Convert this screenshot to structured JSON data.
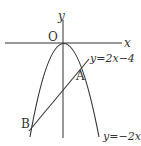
{
  "figure": {
    "axis_labels": {
      "x": "x",
      "y": "y",
      "origin": "O"
    },
    "points": {
      "A": "A",
      "B": "B"
    },
    "curves": {
      "line": "y=2x−4",
      "parabola": "y=−2x²"
    },
    "colors": {
      "stroke": "#333333",
      "background": "#ffffff"
    }
  }
}
